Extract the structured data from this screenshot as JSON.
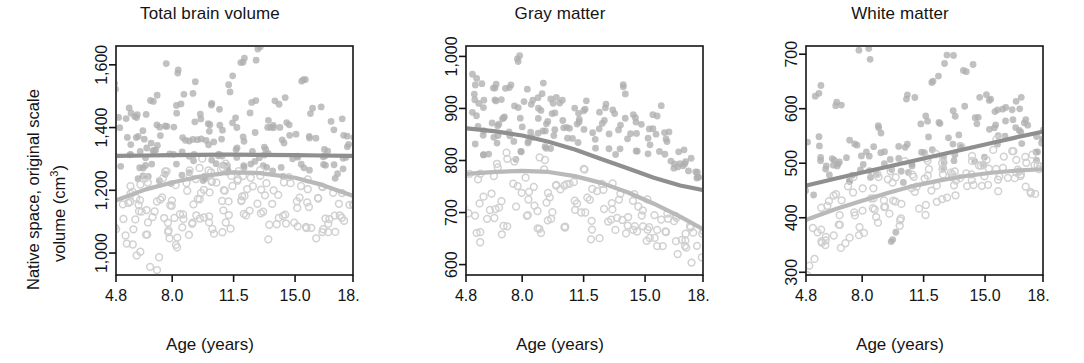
{
  "figure": {
    "width": 1084,
    "height": 363,
    "background": "#ffffff",
    "ylabel_line1": "Native space, original scale",
    "ylabel_line2": "volume (cm",
    "ylabel_sup": "3",
    "ylabel_line2_end": ")",
    "xlabel": "Age (years)",
    "axis_color": "#141414",
    "series_colors": {
      "upper_dark": "#8f8f8f",
      "lower_light": "#b9b9b9",
      "filled_points": "#b0b0b0",
      "open_points": "#cfcfcf"
    }
  },
  "chart_data": [
    {
      "type": "scatter",
      "title": "Total brain volume",
      "xlabel": "Age (years)",
      "ylabel": "Native space, original scale volume (cm3)",
      "xlim": [
        4.8,
        18.3
      ],
      "ylim": [
        930,
        1660
      ],
      "xticks": [
        "4.8",
        "8.0",
        "11.5",
        "15.0",
        "18.3"
      ],
      "xtick_values": [
        4.8,
        8.0,
        11.5,
        15.0,
        18.3
      ],
      "yticks": [
        "1,000",
        "1,200",
        "1,400",
        "1,600"
      ],
      "ytick_values": [
        1000,
        1200,
        1400,
        1600
      ],
      "grid": false,
      "legend": "none",
      "series": [
        {
          "name": "group-filled-fit",
          "style": "line",
          "color": "#8f8f8f",
          "x": [
            4.8,
            6.5,
            8.0,
            9.5,
            11.0,
            11.5,
            13.0,
            15.0,
            16.5,
            18.3
          ],
          "values": [
            1310,
            1311,
            1312,
            1313,
            1314,
            1314,
            1313,
            1312,
            1311,
            1310
          ]
        },
        {
          "name": "group-open-fit",
          "style": "line",
          "color": "#b9b9b9",
          "x": [
            4.8,
            6.5,
            8.0,
            9.5,
            11.0,
            11.5,
            13.0,
            15.0,
            16.5,
            18.3
          ],
          "values": [
            1168,
            1203,
            1225,
            1243,
            1255,
            1257,
            1255,
            1240,
            1218,
            1182
          ]
        },
        {
          "name": "group-filled-points",
          "style": "points-filled",
          "color": "#b0b0b0",
          "x": [
            5.0,
            5.2,
            5.4,
            5.6,
            5.8,
            6.0,
            6.1,
            6.3,
            6.5,
            6.7,
            6.9,
            7.0,
            7.2,
            7.4,
            7.6,
            7.8,
            8.0,
            8.2,
            8.4,
            8.6,
            8.8,
            9.0,
            9.2,
            9.4,
            9.6,
            9.8,
            10.0,
            10.2,
            10.4,
            10.6,
            10.8,
            11.0,
            11.2,
            11.4,
            11.6,
            11.8,
            12.0,
            12.2,
            12.4,
            12.6,
            12.8,
            13.0,
            13.2,
            13.4,
            13.6,
            13.8,
            14.0,
            14.2,
            14.5,
            14.8,
            15.0,
            15.3,
            15.6,
            15.9,
            16.2,
            16.5,
            16.8,
            17.1,
            17.4,
            17.7,
            18.0,
            18.2
          ],
          "values": [
            1520,
            1410,
            1290,
            1350,
            1460,
            1250,
            1380,
            1440,
            1300,
            1270,
            1355,
            1490,
            1330,
            1395,
            1240,
            1420,
            1580,
            1310,
            1460,
            1260,
            1375,
            1520,
            1300,
            1340,
            1430,
            1250,
            1400,
            1360,
            1480,
            1290,
            1320,
            1390,
            1260,
            1540,
            1330,
            1420,
            1615,
            1280,
            1360,
            1470,
            1310,
            1640,
            1340,
            1290,
            1420,
            1380,
            1260,
            1490,
            1350,
            1400,
            1310,
            1550,
            1280,
            1370,
            1440,
            1300,
            1320,
            1260,
            1410,
            1350,
            1290,
            1380
          ]
        },
        {
          "name": "group-open-points",
          "style": "points-open",
          "color": "#cfcfcf",
          "x": [
            5.0,
            5.3,
            5.5,
            5.7,
            5.9,
            6.1,
            6.3,
            6.5,
            6.7,
            6.9,
            7.1,
            7.3,
            7.5,
            7.7,
            7.9,
            8.1,
            8.3,
            8.5,
            8.7,
            8.9,
            9.1,
            9.3,
            9.5,
            9.7,
            9.9,
            10.1,
            10.3,
            10.5,
            10.7,
            10.9,
            11.1,
            11.3,
            11.5,
            11.7,
            11.9,
            12.1,
            12.4,
            12.7,
            13.0,
            13.3,
            13.6,
            13.9,
            14.2,
            14.5,
            14.8,
            15.1,
            15.4,
            15.7,
            16.0,
            16.3,
            16.6,
            16.9,
            17.2,
            17.5,
            17.8,
            18.1
          ],
          "values": [
            1090,
            1150,
            1050,
            1200,
            1120,
            1010,
            1170,
            1230,
            1080,
            1140,
            960,
            1190,
            1060,
            1250,
            1110,
            1170,
            1040,
            1220,
            1130,
            1070,
            1260,
            1150,
            1100,
            1280,
            1180,
            1120,
            1240,
            1060,
            1200,
            1150,
            1290,
            1100,
            1230,
            1170,
            1260,
            1120,
            1190,
            1250,
            1140,
            1210,
            1070,
            1180,
            1130,
            1240,
            1090,
            1160,
            1220,
            1100,
            1150,
            1060,
            1190,
            1120,
            1080,
            1170,
            1110,
            1140
          ]
        }
      ]
    },
    {
      "type": "scatter",
      "title": "Gray matter",
      "xlabel": "Age (years)",
      "ylabel": "Native space, original scale volume (cm3)",
      "xlim": [
        4.8,
        18.3
      ],
      "ylim": [
        580,
        1020
      ],
      "xticks": [
        "4.8",
        "8.0",
        "11.5",
        "15.0",
        "18.3"
      ],
      "xtick_values": [
        4.8,
        8.0,
        11.5,
        15.0,
        18.3
      ],
      "yticks": [
        "600",
        "700",
        "800",
        "900",
        "1,000"
      ],
      "ytick_values": [
        600,
        700,
        800,
        900,
        1000
      ],
      "grid": false,
      "legend": "none",
      "series": [
        {
          "name": "group-filled-fit",
          "style": "line",
          "color": "#8f8f8f",
          "x": [
            4.8,
            6.5,
            8.0,
            9.5,
            11.0,
            12.5,
            14.0,
            15.5,
            17.0,
            18.3
          ],
          "values": [
            862,
            856,
            848,
            836,
            821,
            803,
            785,
            767,
            752,
            743
          ]
        },
        {
          "name": "group-open-fit",
          "style": "line",
          "color": "#b9b9b9",
          "x": [
            4.8,
            6.5,
            8.0,
            9.5,
            11.0,
            12.5,
            14.0,
            15.5,
            17.0,
            18.3
          ],
          "values": [
            774,
            778,
            780,
            778,
            770,
            757,
            739,
            717,
            692,
            668
          ]
        },
        {
          "name": "group-filled-points",
          "style": "points-filled",
          "color": "#b0b0b0",
          "x": [
            5.0,
            5.2,
            5.4,
            5.6,
            5.8,
            6.0,
            6.2,
            6.4,
            6.6,
            6.8,
            7.0,
            7.2,
            7.4,
            7.6,
            7.8,
            8.0,
            8.2,
            8.4,
            8.6,
            8.8,
            9.0,
            9.2,
            9.4,
            9.6,
            9.8,
            10.0,
            10.3,
            10.6,
            10.9,
            11.2,
            11.5,
            11.8,
            12.1,
            12.4,
            12.7,
            13.0,
            13.3,
            13.6,
            13.9,
            14.2,
            14.5,
            14.8,
            15.1,
            15.4,
            15.7,
            16.0,
            16.3,
            16.6,
            16.9,
            17.2,
            17.5,
            17.8,
            18.1
          ],
          "values": [
            930,
            880,
            960,
            845,
            900,
            820,
            955,
            870,
            835,
            915,
            885,
            850,
            940,
            810,
            890,
            1000,
            860,
            925,
            840,
            895,
            870,
            935,
            815,
            880,
            905,
            850,
            920,
            865,
            830,
            895,
            875,
            910,
            840,
            885,
            855,
            900,
            820,
            870,
            930,
            845,
            880,
            810,
            860,
            835,
            895,
            820,
            850,
            790,
            805,
            780,
            795,
            765,
            775
          ]
        },
        {
          "name": "group-open-points",
          "style": "points-open",
          "color": "#cfcfcf",
          "x": [
            5.0,
            5.3,
            5.6,
            5.9,
            6.2,
            6.5,
            6.8,
            7.1,
            7.4,
            7.7,
            8.0,
            8.3,
            8.6,
            8.9,
            9.2,
            9.5,
            9.8,
            10.1,
            10.4,
            10.7,
            11.0,
            11.3,
            11.6,
            11.9,
            12.2,
            12.5,
            12.8,
            13.1,
            13.4,
            13.7,
            14.0,
            14.3,
            14.6,
            14.9,
            15.2,
            15.5,
            15.8,
            16.1,
            16.4,
            16.7,
            17.0,
            17.3,
            17.6,
            17.9,
            18.2
          ],
          "values": [
            700,
            760,
            650,
            730,
            690,
            780,
            720,
            660,
            800,
            745,
            695,
            755,
            710,
            670,
            790,
            735,
            700,
            760,
            680,
            745,
            715,
            775,
            690,
            730,
            660,
            750,
            705,
            680,
            740,
            700,
            665,
            720,
            690,
            650,
            710,
            675,
            640,
            695,
            660,
            680,
            635,
            670,
            645,
            620,
            655
          ]
        }
      ]
    },
    {
      "type": "scatter",
      "title": "White matter",
      "xlabel": "Age (years)",
      "ylabel": "Native space, original scale volume (cm3)",
      "xlim": [
        4.8,
        18.3
      ],
      "ylim": [
        295,
        715
      ],
      "xticks": [
        "4.8",
        "8.0",
        "11.5",
        "15.0",
        "18.3"
      ],
      "xtick_values": [
        4.8,
        8.0,
        11.5,
        15.0,
        18.3
      ],
      "yticks": [
        "300",
        "400",
        "500",
        "600",
        "700"
      ],
      "ytick_values": [
        300,
        400,
        500,
        600,
        700
      ],
      "grid": false,
      "legend": "none",
      "series": [
        {
          "name": "group-filled-fit",
          "style": "line",
          "color": "#8f8f8f",
          "x": [
            4.8,
            6.5,
            8.0,
            9.5,
            11.0,
            12.5,
            14.0,
            15.5,
            17.0,
            18.3
          ],
          "values": [
            459,
            472,
            483,
            494,
            505,
            516,
            527,
            538,
            549,
            558
          ]
        },
        {
          "name": "group-open-fit",
          "style": "line",
          "color": "#b9b9b9",
          "x": [
            4.8,
            6.5,
            8.0,
            9.5,
            11.0,
            12.5,
            14.0,
            15.5,
            17.0,
            18.3
          ],
          "values": [
            396,
            416,
            431,
            446,
            459,
            469,
            477,
            483,
            487,
            489
          ]
        },
        {
          "name": "group-filled-points",
          "style": "points-filled",
          "color": "#b0b0b0",
          "x": [
            5.0,
            5.2,
            5.5,
            5.8,
            6.0,
            6.3,
            6.6,
            6.9,
            7.2,
            7.5,
            7.8,
            8.1,
            8.4,
            8.7,
            9.0,
            9.3,
            9.6,
            9.9,
            10.2,
            10.5,
            10.8,
            11.1,
            11.4,
            11.7,
            12.0,
            12.3,
            12.6,
            12.9,
            13.2,
            13.5,
            13.8,
            14.1,
            14.4,
            14.7,
            15.0,
            15.3,
            15.6,
            15.9,
            16.2,
            16.5,
            16.8,
            17.1,
            17.4,
            17.7,
            18.0,
            18.2
          ],
          "values": [
            450,
            540,
            630,
            480,
            520,
            490,
            605,
            510,
            470,
            545,
            500,
            705,
            525,
            480,
            560,
            515,
            360,
            495,
            540,
            470,
            620,
            510,
            580,
            535,
            650,
            495,
            560,
            690,
            520,
            600,
            545,
            680,
            575,
            510,
            625,
            560,
            600,
            535,
            590,
            570,
            610,
            545,
            585,
            520,
            560,
            540
          ]
        },
        {
          "name": "group-open-points",
          "style": "points-open",
          "color": "#cfcfcf",
          "x": [
            5.0,
            5.3,
            5.6,
            5.9,
            6.2,
            6.5,
            6.8,
            7.1,
            7.4,
            7.7,
            8.0,
            8.3,
            8.6,
            8.9,
            9.2,
            9.5,
            9.8,
            10.1,
            10.4,
            10.7,
            11.0,
            11.3,
            11.6,
            11.9,
            12.2,
            12.5,
            12.8,
            13.1,
            13.4,
            13.7,
            14.0,
            14.3,
            14.6,
            14.9,
            15.2,
            15.5,
            15.8,
            16.1,
            16.4,
            16.7,
            17.0,
            17.3,
            17.6,
            17.9,
            18.2
          ],
          "values": [
            310,
            380,
            350,
            420,
            365,
            440,
            395,
            355,
            460,
            410,
            375,
            445,
            400,
            430,
            465,
            415,
            480,
            440,
            400,
            490,
            455,
            420,
            500,
            470,
            435,
            510,
            480,
            450,
            495,
            465,
            520,
            485,
            455,
            505,
            475,
            530,
            490,
            460,
            515,
            480,
            500,
            470,
            510,
            455,
            490
          ]
        }
      ]
    }
  ]
}
